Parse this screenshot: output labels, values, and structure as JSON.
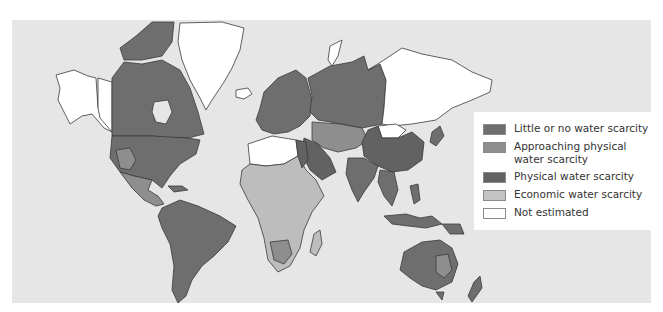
{
  "map": {
    "title": "",
    "colors": {
      "ocean": "#e6e6e6",
      "little_or_no": "#6e6e6e",
      "approaching_physical": "#8e8e8e",
      "physical": "#5f5f5f",
      "economic": "#bdbdbd",
      "not_estimated": "#ffffff",
      "border": "#3a3a3a"
    }
  },
  "legend": {
    "items": [
      {
        "label": "Little or no water scarcity",
        "color": "#6e6e6e"
      },
      {
        "label_line1": "Approaching physical",
        "label_line2": "water scarcity",
        "color": "#8e8e8e"
      },
      {
        "label": "Physical water scarcity",
        "color": "#626262"
      },
      {
        "label": "Economic water scarcity",
        "color": "#c4c4c4"
      },
      {
        "label": "Not estimated",
        "color": "#ffffff"
      }
    ]
  }
}
